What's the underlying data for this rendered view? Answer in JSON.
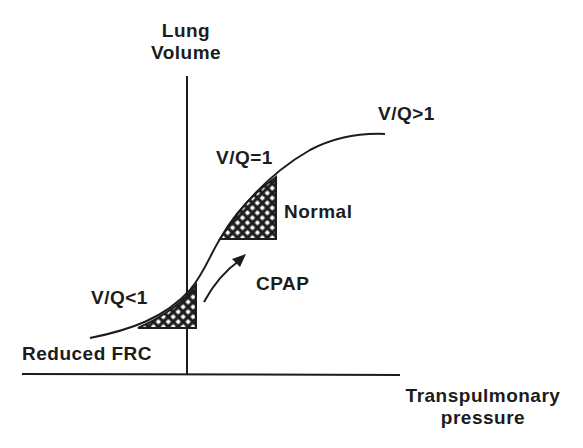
{
  "diagram": {
    "y_axis_label": {
      "line1": "Lung",
      "line2": "Volume"
    },
    "x_axis_label": {
      "line1": "Transpulmonary",
      "line2": "pressure"
    },
    "annotations": {
      "vq_low": "V/Q<1",
      "vq_normal": "V/Q=1",
      "vq_high": "V/Q>1",
      "normal": "Normal",
      "cpap": "CPAP",
      "reduced_frc": "Reduced FRC"
    },
    "colors": {
      "ink": "#1c1c1c",
      "background": "#ffffff"
    }
  }
}
